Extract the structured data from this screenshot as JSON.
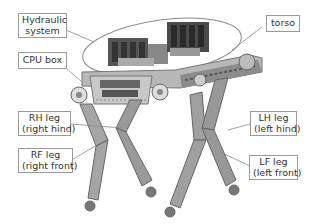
{
  "diagram": {
    "labels": {
      "hydraulic_system": [
        "Hydraulic",
        "system"
      ],
      "cpu_box": "CPU box",
      "torso": "torso",
      "rh_leg": [
        "RH leg",
        "(right hind)"
      ],
      "rf_leg": [
        "RF leg",
        "(right front)"
      ],
      "lh_leg": [
        "LH leg",
        "(left hind)"
      ],
      "lf_leg": [
        "LF leg",
        "(left front)"
      ]
    },
    "colors": {
      "label_border": "#9a9a9a",
      "leader_line": "#8a8a8a",
      "robot_metal": "#9c9c9c",
      "robot_dark": "#444444"
    }
  }
}
